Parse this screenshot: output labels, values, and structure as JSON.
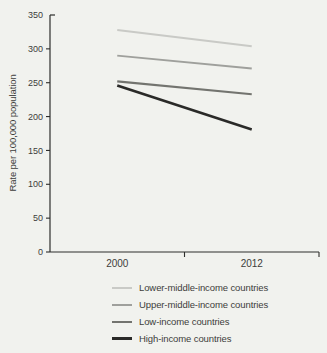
{
  "figure": {
    "background": "#f1f2ee"
  },
  "chart_data": {
    "type": "line",
    "title": "",
    "xlabel": "",
    "ylabel": "Rate per 100,000 population",
    "x": [
      2000,
      2012
    ],
    "xticklabels": [
      "2000",
      "2012"
    ],
    "ylim": [
      0,
      350
    ],
    "yticks": [
      0,
      50,
      100,
      150,
      200,
      250,
      300,
      350
    ],
    "grid": false,
    "legend_position": "bottom",
    "axis_color": "#2e2e2c",
    "text_color": "#3d3d3b",
    "series": [
      {
        "name": "Lower-middle-income countries",
        "values": [
          328,
          304
        ],
        "color": "#c9cac6",
        "line_width": 2
      },
      {
        "name": "Upper-middle-income countries",
        "values": [
          290,
          271
        ],
        "color": "#9fa09c",
        "line_width": 2
      },
      {
        "name": "Low-income countries",
        "values": [
          252,
          233
        ],
        "color": "#73746f",
        "line_width": 2.2
      },
      {
        "name": "High-income countries",
        "values": [
          246,
          181
        ],
        "color": "#2a2a28",
        "line_width": 2.6
      }
    ]
  }
}
